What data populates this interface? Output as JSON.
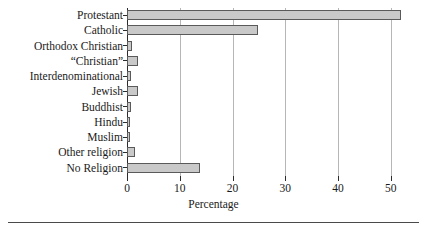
{
  "chart_data": {
    "type": "bar",
    "orientation": "horizontal",
    "title": "",
    "xlabel": "Percentage",
    "ylabel": "",
    "xlim": [
      0,
      52.5
    ],
    "xticks": [
      0,
      10,
      20,
      30,
      40,
      50
    ],
    "xticklabels": [
      "0",
      "10",
      "20",
      "30",
      "40",
      "50"
    ],
    "grid": "vertical",
    "legend": "none",
    "categories": [
      "Protestant",
      "Catholic",
      "Orthodox Christian",
      "“Christian”",
      "Interdenominational",
      "Jewish",
      "Buddhist",
      "Hindu",
      "Muslim",
      "Other religion",
      "No Religion"
    ],
    "values": [
      52.0,
      24.8,
      1.0,
      2.0,
      0.8,
      2.0,
      0.7,
      0.5,
      0.5,
      1.5,
      13.8
    ],
    "bar_fill": "#c9c9c9",
    "bar_edge": "#5a5a5a",
    "grid_color": "#b6b6b6",
    "axis_color": "#2b2b2b"
  }
}
